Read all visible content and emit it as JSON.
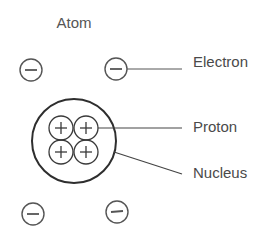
{
  "diagram": {
    "title": "Atom",
    "labels": {
      "electron": "Electron",
      "proton": "Proton",
      "nucleus": "Nucleus"
    },
    "particles": {
      "electron_symbol": "−",
      "proton_symbol": "+",
      "electron_count": 4,
      "proton_count": 4
    },
    "colors": {
      "stroke": "#3a3a3a",
      "text": "#4a4a4a",
      "background": "#ffffff"
    }
  }
}
